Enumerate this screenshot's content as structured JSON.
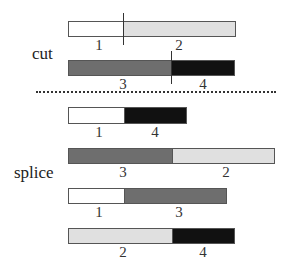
{
  "labels": {
    "cut": "cut",
    "splice": "splice"
  },
  "colors": {
    "seg1": "#ffffff",
    "seg2": "#e0e0e0",
    "seg3": "#6e6e6e",
    "seg4": "#111111"
  },
  "rows": [
    {
      "group": "cut",
      "segments": [
        {
          "id": "1",
          "label": "1"
        },
        {
          "id": "2",
          "label": "2"
        }
      ]
    },
    {
      "group": "cut",
      "segments": [
        {
          "id": "3",
          "label": "3"
        },
        {
          "id": "4",
          "label": "4"
        }
      ]
    },
    {
      "group": "splice",
      "segments": [
        {
          "id": "1",
          "label": "1"
        },
        {
          "id": "4",
          "label": "4"
        }
      ]
    },
    {
      "group": "splice",
      "segments": [
        {
          "id": "3",
          "label": "3"
        },
        {
          "id": "2",
          "label": "2"
        }
      ]
    },
    {
      "group": "splice",
      "segments": [
        {
          "id": "1",
          "label": "1"
        },
        {
          "id": "3",
          "label": "3"
        }
      ]
    },
    {
      "group": "splice",
      "segments": [
        {
          "id": "2",
          "label": "2"
        },
        {
          "id": "4",
          "label": "4"
        }
      ]
    }
  ]
}
